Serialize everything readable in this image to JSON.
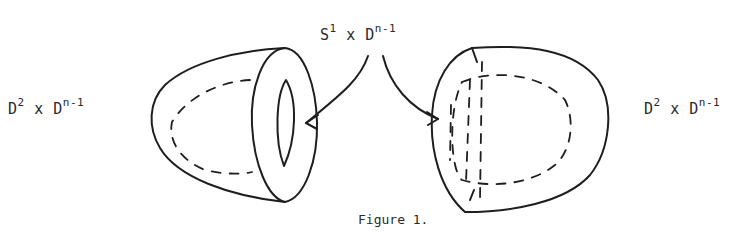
{
  "figure": {
    "caption": "Figure 1.",
    "top_label": {
      "base1": "S",
      "sup1": "1",
      "times": "x",
      "base2": "D",
      "sup2": "n-1"
    },
    "left_label": {
      "base1": "D",
      "sup1": "2",
      "times": "x",
      "base2": "D",
      "sup2": "n-1"
    },
    "right_label": {
      "base1": "D",
      "sup1": "2",
      "times": "x",
      "base2": "D",
      "sup2": "n-1"
    },
    "shapes": [
      {
        "name": "left-solid",
        "description": "cup-shaped solid with annular face"
      },
      {
        "name": "right-solid",
        "description": "rounded solid with dashed interior region"
      }
    ],
    "arrows": [
      {
        "from": "top-label",
        "to": "left-solid-annulus"
      },
      {
        "from": "top-label",
        "to": "right-solid-boundary"
      }
    ]
  }
}
